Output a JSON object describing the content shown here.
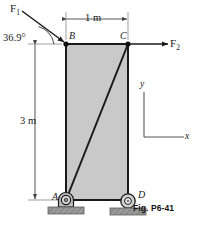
{
  "figure": {
    "caption": "Fig. P6-41",
    "body_fill": "#c9c9c9",
    "line_color": "#1a1a1a",
    "ground_fill": "#8a8a8a",
    "dimension_color": "#555555"
  },
  "labels": {
    "force_1": "F",
    "force_1_sub": "1",
    "force_2": "F",
    "force_2_sub": "2",
    "angle": "36.9°",
    "dim_horizontal": "1 m",
    "dim_vertical": "3 m",
    "point_a": "A",
    "point_b": "B",
    "point_c": "C",
    "point_d": "D",
    "axis_x": "x",
    "axis_y": "y"
  },
  "geometry": {
    "point_a": [
      66,
      200
    ],
    "point_b": [
      66,
      44
    ],
    "point_c": [
      128,
      44
    ],
    "point_d": [
      128,
      200
    ],
    "span_horizontal_m": 1,
    "span_vertical_m": 3,
    "force_1_angle_deg": 36.9
  }
}
